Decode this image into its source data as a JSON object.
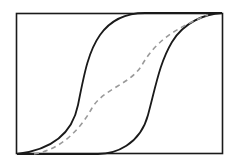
{
  "diagram": {
    "type": "hysteresis-loop",
    "frame": {
      "x": 16,
      "y": 13,
      "width": 207,
      "height": 141,
      "stroke": "#1a1a1a"
    },
    "curves": [
      {
        "name": "left-branch",
        "style": "solid",
        "color": "#1a1a1a"
      },
      {
        "name": "right-branch",
        "style": "solid",
        "color": "#1a1a1a"
      },
      {
        "name": "middle-dashed-curve",
        "style": "dashed",
        "color": "#9a9a9a"
      }
    ]
  }
}
